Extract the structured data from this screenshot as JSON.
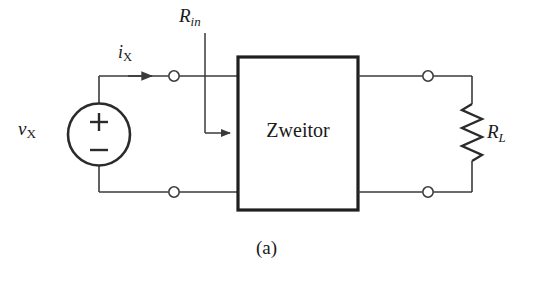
{
  "figure": {
    "caption": "(a)",
    "background_color": "#ffffff",
    "line_color": "#3a3a3a",
    "box_border_color": "#1f1f1f",
    "text_color": "#1a1a1a"
  },
  "two_port": {
    "block_label": "Zweitor",
    "block_name": "two-port-network-block"
  },
  "source": {
    "symbol_name": "independent-voltage-source",
    "label_main": "v",
    "label_sub": "X",
    "polarity_plus": "+",
    "polarity_minus": "−"
  },
  "input_current": {
    "label_main": "i",
    "label_sub": "X",
    "arrow_name": "current-direction-arrow"
  },
  "input_resistance": {
    "label_main": "R",
    "label_sub": "in",
    "arrow_name": "input-resistance-pointer-arrow"
  },
  "load": {
    "symbol_name": "resistor-zigzag",
    "label_main": "R",
    "label_sub": "L"
  },
  "terminals": {
    "count": 4,
    "names": [
      "terminal-input-top",
      "terminal-input-bottom",
      "terminal-output-top",
      "terminal-output-bottom"
    ]
  }
}
